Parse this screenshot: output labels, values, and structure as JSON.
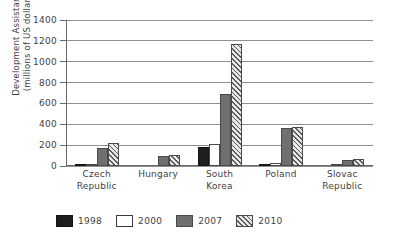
{
  "chart_data": {
    "type": "bar",
    "title": "",
    "subtitle": "",
    "xlabel": "",
    "ylabel_line1": "Development Assistance",
    "ylabel_line2": "(millions of US dollars)",
    "categories": [
      {
        "line1": "Czech",
        "line2": "Republic"
      },
      {
        "line1": "Hungary",
        "line2": ""
      },
      {
        "line1": "South",
        "line2": "Korea"
      },
      {
        "line1": "Poland",
        "line2": ""
      },
      {
        "line1": "Slovac",
        "line2": "Republic"
      }
    ],
    "category_names": [
      "Czech Republic",
      "Hungary",
      "South Korea",
      "Poland",
      "Slovac Republic"
    ],
    "series": [
      {
        "name": "1998",
        "style": "solid-black",
        "color": "#1e1e1e",
        "values": [
          8,
          0,
          180,
          15,
          0
        ]
      },
      {
        "name": "2000",
        "style": "outline-white",
        "color": "#ffffff",
        "values": [
          15,
          0,
          210,
          30,
          5
        ]
      },
      {
        "name": "2007",
        "style": "solid-gray",
        "color": "#6f6f6f",
        "values": [
          170,
          100,
          690,
          360,
          60
        ]
      },
      {
        "name": "2010",
        "style": "hatched",
        "color": "#5a5a5a",
        "values": [
          220,
          110,
          1170,
          375,
          70
        ]
      }
    ],
    "ylim": [
      0,
      1400
    ],
    "yticks": [
      0,
      200,
      400,
      600,
      800,
      1000,
      1200,
      1400
    ],
    "grid": true,
    "legend_position": "bottom",
    "legend_entries": [
      "1998",
      "2000",
      "2007",
      "2010"
    ]
  }
}
